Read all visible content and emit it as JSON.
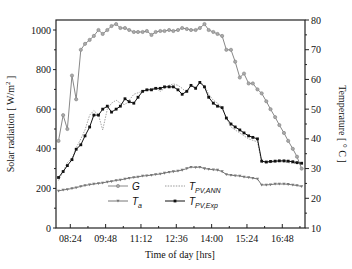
{
  "chart_data": {
    "type": "line",
    "title": "",
    "xlabel": "Time of day [hrs]",
    "ylabel_left": "Solar radiation [ W/m^2 ]",
    "ylabel_right": "Temperature [ ° C ]",
    "x_tick_labels": [
      "08:24",
      "09:48",
      "11:12",
      "12:36",
      "14:00",
      "15:24",
      "16:48"
    ],
    "y_left_ticks": [
      0,
      200,
      400,
      600,
      800,
      1000
    ],
    "y_right_ticks": [
      10,
      20,
      30,
      40,
      50,
      60,
      70,
      80
    ],
    "ylim_left": [
      0,
      1050
    ],
    "ylim_right": [
      10,
      80
    ],
    "grid": false,
    "legend_position": "lower center",
    "x_minutes": [
      476,
      487,
      497,
      508,
      518,
      529,
      539,
      550,
      560,
      571,
      581,
      592,
      602,
      613,
      623,
      634,
      644,
      655,
      665,
      676,
      686,
      697,
      707,
      718,
      728,
      739,
      749,
      760,
      770,
      781,
      791,
      802,
      812,
      823,
      833,
      844,
      854,
      865,
      875,
      886,
      896,
      907,
      917,
      928,
      938,
      949,
      959,
      970,
      980,
      991,
      1001,
      1012,
      1022,
      1033,
      1043,
      1054
    ],
    "series": [
      {
        "name": "G",
        "axis": "left",
        "color": "#888888",
        "marker": "circle",
        "values": [
          440,
          570,
          500,
          770,
          650,
          900,
          930,
          950,
          970,
          1000,
          980,
          1000,
          1020,
          1030,
          1010,
          1010,
          1000,
          990,
          990,
          990,
          995,
          975,
          990,
          995,
          995,
          1000,
          995,
          1000,
          1010,
          1005,
          1000,
          1000,
          1010,
          1030,
          1000,
          990,
          980,
          970,
          900,
          900,
          840,
          760,
          780,
          730,
          730,
          700,
          680,
          640,
          600,
          560,
          520,
          480,
          440,
          400,
          360,
          300
        ],
        "unit": "W/m^2"
      },
      {
        "name": "T_a",
        "axis": "right",
        "color": "#777777",
        "marker": "triangle-down",
        "values": [
          22.5,
          22.8,
          23.0,
          23.3,
          23.6,
          24.0,
          24.3,
          24.6,
          24.8,
          25.0,
          25.2,
          25.5,
          25.7,
          26.0,
          26.2,
          26.5,
          26.8,
          27.0,
          27.2,
          27.5,
          27.6,
          27.8,
          28.0,
          28.2,
          28.5,
          28.8,
          29.0,
          29.2,
          29.5,
          30.0,
          30.5,
          30.4,
          30.5,
          30.0,
          29.8,
          29.6,
          29.5,
          29.0,
          28.0,
          27.8,
          27.6,
          27.5,
          27.2,
          27.0,
          26.8,
          26.5,
          24.5,
          24.5,
          24.6,
          24.8,
          24.8,
          24.8,
          24.7,
          24.5,
          24.3,
          24.0
        ],
        "unit": "°C"
      },
      {
        "name": "T_PV,ANN",
        "axis": "right",
        "color": "#999999",
        "marker": "none",
        "dashed": true,
        "values": [
          26.0,
          29.0,
          32.0,
          33.5,
          37.0,
          40.0,
          43.0,
          48.0,
          49.5,
          48.0,
          43.0,
          50.0,
          52.0,
          53.0,
          52.0,
          51.5,
          53.0,
          55.0,
          55.5,
          56.0,
          56.5,
          57.0,
          57.0,
          56.0,
          57.0,
          58.0,
          58.5,
          58.0,
          57.0,
          55.5,
          58.0,
          57.5,
          59.0,
          58.0,
          55.0,
          53.0,
          52.0,
          50.5,
          47.0,
          44.0,
          43.0,
          42.0,
          41.0,
          40.0,
          39.5,
          39.0,
          32.0,
          32.2,
          32.0,
          32.3,
          32.4,
          32.2,
          32.0,
          31.8,
          31.6,
          31.5
        ],
        "unit": "°C"
      },
      {
        "name": "T_PV,Exp",
        "axis": "right",
        "color": "#111111",
        "marker": "square",
        "values": [
          27.0,
          29.0,
          31.0,
          33.0,
          36.5,
          38.0,
          41.0,
          44.0,
          48.0,
          48.0,
          50.0,
          51.0,
          49.0,
          50.0,
          51.0,
          53.5,
          52.5,
          52.0,
          54.0,
          56.0,
          56.5,
          56.5,
          57.0,
          57.0,
          57.5,
          57.5,
          57.5,
          56.5,
          55.0,
          56.0,
          58.0,
          57.0,
          59.0,
          57.5,
          54.0,
          52.0,
          51.0,
          50.5,
          47.0,
          45.0,
          44.0,
          43.0,
          42.0,
          41.0,
          40.5,
          40.0,
          32.5,
          32.2,
          32.4,
          32.5,
          32.6,
          32.6,
          32.5,
          32.3,
          32.0,
          31.8
        ],
        "unit": "°C"
      }
    ],
    "legend": [
      {
        "label": "G",
        "sub": ""
      },
      {
        "label": "T",
        "sub": "PV,ANN"
      },
      {
        "label": "T",
        "sub": "a"
      },
      {
        "label": "T",
        "sub": "PV,Exp"
      }
    ]
  }
}
